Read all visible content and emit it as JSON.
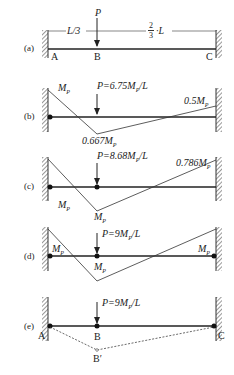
{
  "figure": {
    "panels": [
      {
        "id": "a",
        "caption": "(a)",
        "labels": {
          "span_left": "L/3",
          "span_right_num": "2",
          "span_right_den": "3",
          "span_right_suffix": "·L",
          "load": "P",
          "A": "A",
          "B": "B",
          "C": "C"
        }
      },
      {
        "id": "b",
        "caption": "(b)",
        "labels": {
          "load": "P=6.75M",
          "load_suffix": "/L",
          "left": "M",
          "mid": "0.667M",
          "right": "0.5M",
          "sub": "P"
        }
      },
      {
        "id": "c",
        "caption": "(c)",
        "labels": {
          "load": "P=8.68M",
          "load_suffix": "/L",
          "left": "M",
          "mid": "M",
          "right": "0.786M",
          "sub": "P"
        }
      },
      {
        "id": "d",
        "caption": "(d)",
        "labels": {
          "load": "P=9M",
          "load_suffix": "/L",
          "left": "M",
          "mid": "M",
          "right": "M",
          "sub": "P"
        }
      },
      {
        "id": "e",
        "caption": "(e)",
        "labels": {
          "load": "P=9M",
          "load_suffix": "/L",
          "A": "A",
          "B": "B",
          "C": "C",
          "Bprime": "B′",
          "sub": "P"
        }
      }
    ]
  }
}
